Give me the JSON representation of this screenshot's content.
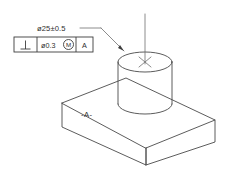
{
  "drawing": {
    "title": "Perpendicularity callout on cylindrical boss",
    "type": "isometric-technical-drawing",
    "background_color": "#ffffff",
    "line_color": "#4a4a4a",
    "text_color": "#2e2e2e"
  },
  "callout": {
    "diameter_dimension": "ø25±0.5",
    "leader_name": "leader-line"
  },
  "feature_control_frame": {
    "geometric_symbol": "⊥",
    "geometric_symbol_name": "perpendicularity-icon",
    "tolerance_value": "ø0.3",
    "material_condition_modifier": "M",
    "material_condition_name": "mmc-modifier-icon",
    "datum_reference": "A"
  },
  "part": {
    "datum_feature_label": "-A-",
    "base_plate_name": "base-plate",
    "cylinder_name": "cylindrical-boss",
    "axis_name": "center-axis-line",
    "center_mark": "✕"
  }
}
